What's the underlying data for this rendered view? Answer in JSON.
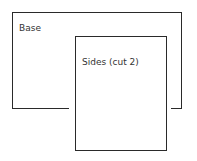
{
  "diagram": {
    "shapes": [
      {
        "id": "base",
        "label": "Base"
      },
      {
        "id": "sides",
        "label": "Sides (cut 2)"
      }
    ],
    "colors": {
      "stroke": "#2a2a2a",
      "text": "#333333",
      "background": "#ffffff"
    }
  }
}
